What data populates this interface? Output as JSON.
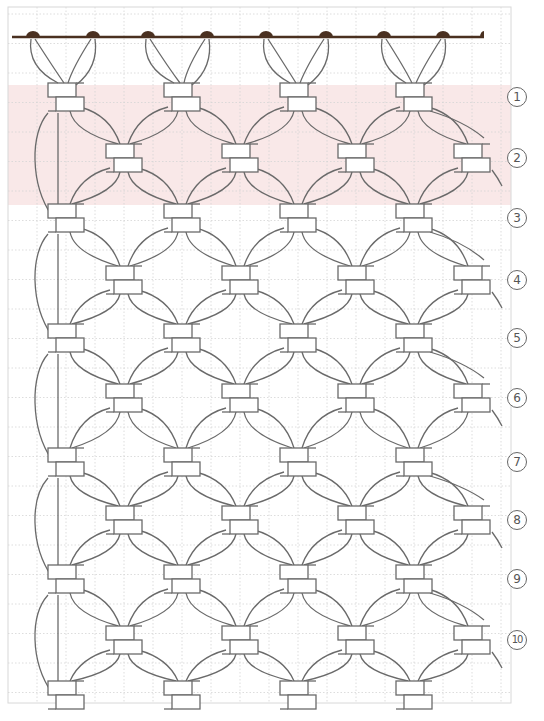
{
  "diagram": {
    "frame": {
      "x": 8,
      "y": 7,
      "width": 503,
      "height": 696,
      "border_color": "#d8d8d8"
    },
    "grid": {
      "color": "#d4d4d4",
      "spacing_x": 29,
      "spacing_y": 29.5,
      "style": "dotted"
    },
    "highlight_band": {
      "y_top": 85,
      "y_bottom": 205,
      "color": "#f9e8e8",
      "covers_rows": [
        "1",
        "2"
      ]
    },
    "rod": {
      "y": 37,
      "x_start": 12,
      "x_end": 484,
      "color": "#4a3020"
    },
    "mounting_bumps_x": [
      33,
      93,
      148,
      207,
      266,
      326,
      384,
      443
    ],
    "cord_color": "#6a6a6a",
    "knot_columns": {
      "odd_rows_x": [
        66,
        182,
        298,
        414
      ],
      "even_rows_x": [
        124,
        240,
        356,
        472
      ]
    },
    "row_labels": [
      {
        "label": "1",
        "y": 97
      },
      {
        "label": "2",
        "y": 158
      },
      {
        "label": "3",
        "y": 218
      },
      {
        "label": "4",
        "y": 280
      },
      {
        "label": "5",
        "y": 338
      },
      {
        "label": "6",
        "y": 398
      },
      {
        "label": "7",
        "y": 462
      },
      {
        "label": "8",
        "y": 520
      },
      {
        "label": "9",
        "y": 579
      },
      {
        "label": "10",
        "y": 640
      }
    ],
    "bottom_row_y": 695,
    "label_x": 503
  }
}
